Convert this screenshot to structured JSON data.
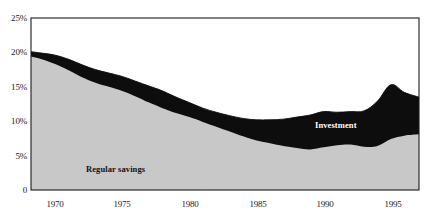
{
  "chart_data": {
    "type": "area",
    "stacked": true,
    "title": "",
    "subtitle": "",
    "xlabel": "",
    "ylabel": "",
    "xlim": [
      1968.2,
      1997.1
    ],
    "ylim": [
      0,
      25
    ],
    "grid": false,
    "legend_position": "inline-annotations",
    "x_tick_labels": [
      "1970",
      "1975",
      "1980",
      "1985",
      "1990",
      "1995"
    ],
    "x_ticks": [
      1970,
      1975,
      1980,
      1985,
      1990,
      1995
    ],
    "y_tick_labels": [
      "0",
      "5%",
      "10%",
      "15%",
      "20%",
      "25%"
    ],
    "y_ticks": [
      0,
      5,
      10,
      15,
      20,
      25
    ],
    "x": [
      1968.2,
      1969,
      1970,
      1971,
      1972,
      1973,
      1974,
      1975,
      1976,
      1977,
      1978,
      1979,
      1980,
      1981,
      1982,
      1983,
      1984,
      1985,
      1986,
      1987,
      1988,
      1989,
      1990,
      1991,
      1992,
      1993,
      1994,
      1995,
      1996,
      1997.1
    ],
    "series": [
      {
        "name": "Regular savings",
        "color": "#c8c8c8",
        "values": [
          19.4,
          19.0,
          18.3,
          17.4,
          16.4,
          15.6,
          15.0,
          14.4,
          13.6,
          12.7,
          11.9,
          11.2,
          10.6,
          9.9,
          9.2,
          8.5,
          7.8,
          7.2,
          6.8,
          6.4,
          6.1,
          5.9,
          6.2,
          6.5,
          6.6,
          6.3,
          6.4,
          7.4,
          7.9,
          8.1
        ]
      },
      {
        "name": "Investment",
        "color": "#0d0d0d",
        "values": [
          0.7,
          0.9,
          1.3,
          1.6,
          1.8,
          1.9,
          2.0,
          2.1,
          2.2,
          2.4,
          2.5,
          2.3,
          2.1,
          2.0,
          2.1,
          2.3,
          2.6,
          3.0,
          3.4,
          3.9,
          4.5,
          5.0,
          5.2,
          4.8,
          4.8,
          5.2,
          6.5,
          7.9,
          6.3,
          5.4
        ]
      }
    ],
    "totals": [
      20.1,
      19.9,
      19.6,
      19.0,
      18.2,
      17.5,
      17.0,
      16.5,
      15.8,
      15.1,
      14.4,
      13.5,
      12.7,
      11.9,
      11.3,
      10.8,
      10.4,
      10.2,
      10.2,
      10.3,
      10.6,
      10.9,
      11.4,
      11.3,
      11.4,
      11.5,
      12.9,
      15.3,
      14.2,
      13.5
    ],
    "annotations": [
      {
        "text": "Regular savings",
        "series": "Regular savings",
        "color": "#111111"
      },
      {
        "text": "Investment",
        "series": "Investment",
        "color": "#ffffff"
      }
    ]
  },
  "axes": {
    "y_labels": [
      "25%",
      "20%",
      "15%",
      "10%",
      "5%",
      "0"
    ],
    "x_labels": [
      "1970",
      "1975",
      "1980",
      "1985",
      "1990",
      "1995"
    ]
  },
  "colors": {
    "savings_fill": "#c8c8c8",
    "investment_fill": "#0d0d0d",
    "frame": "#1a1a1a",
    "background": "#ffffff",
    "text": "#1a1a1a"
  }
}
